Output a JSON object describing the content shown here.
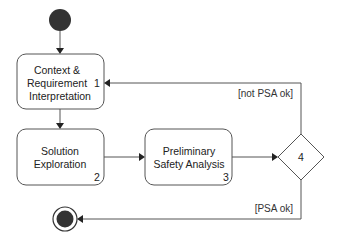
{
  "diagram": {
    "type": "uml-activity",
    "start": {
      "label": ""
    },
    "end": {
      "label": ""
    },
    "activities": [
      {
        "id": 1,
        "lines": [
          "Context &",
          "Requirement",
          "Interpretation"
        ],
        "number": "1"
      },
      {
        "id": 2,
        "lines": [
          "Solution",
          "Exploration"
        ],
        "number": "2"
      },
      {
        "id": 3,
        "lines": [
          "Preliminary",
          "Safety Analysis"
        ],
        "number": "3"
      }
    ],
    "decision": {
      "id": 4,
      "number": "4"
    },
    "guards": {
      "not_ok": "[not PSA ok]",
      "ok": "[PSA ok]"
    },
    "edges": [
      {
        "from": "start",
        "to": "1"
      },
      {
        "from": "1",
        "to": "2"
      },
      {
        "from": "2",
        "to": "3"
      },
      {
        "from": "3",
        "to": "4"
      },
      {
        "from": "4",
        "to": "1",
        "guard": "[not PSA ok]"
      },
      {
        "from": "4",
        "to": "end",
        "guard": "[PSA ok]"
      }
    ],
    "colors": {
      "stroke": "#555555",
      "fill_node": "#333333",
      "background": "#ffffff"
    }
  }
}
